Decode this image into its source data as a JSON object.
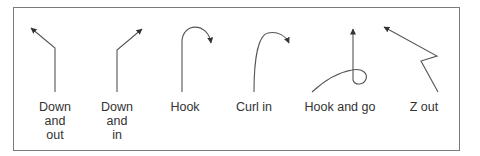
{
  "diagram": {
    "colors": {
      "line": "#444444",
      "frame": "#7a7a7a",
      "text": "#333333"
    },
    "routes": [
      {
        "name": "Down and out",
        "label": "Down\nand\nout"
      },
      {
        "name": "Down and in",
        "label": "Down\nand\nin"
      },
      {
        "name": "Hook",
        "label": "Hook"
      },
      {
        "name": "Curl in",
        "label": "Curl in"
      },
      {
        "name": "Hook and go",
        "label": "Hook and go"
      },
      {
        "name": "Z out",
        "label": "Z out"
      }
    ]
  }
}
